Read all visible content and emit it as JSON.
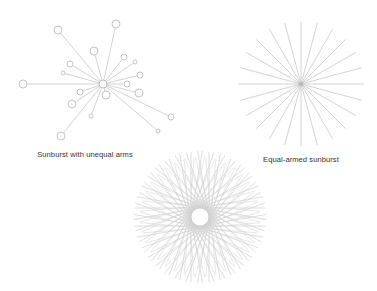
{
  "colors": {
    "line": "#c8c8c8",
    "node_stroke": "#bdbdbd",
    "label": "#333333",
    "background": "#ffffff"
  },
  "diagrams": [
    {
      "id": "unequal",
      "label": "Sunburst with unequal arms",
      "label_pos": [
        85,
        150
      ],
      "center": [
        103,
        84
      ],
      "center_radius": 4,
      "nodes": [
        {
          "x": 58,
          "y": 30,
          "r": 4
        },
        {
          "x": 116,
          "y": 24,
          "r": 4
        },
        {
          "x": 94,
          "y": 51,
          "r": 4
        },
        {
          "x": 70,
          "y": 64,
          "r": 3
        },
        {
          "x": 63,
          "y": 73,
          "r": 2
        },
        {
          "x": 124,
          "y": 57,
          "r": 3
        },
        {
          "x": 135,
          "y": 62,
          "r": 2
        },
        {
          "x": 140,
          "y": 75,
          "r": 3
        },
        {
          "x": 23,
          "y": 84,
          "r": 4
        },
        {
          "x": 127,
          "y": 84,
          "r": 3
        },
        {
          "x": 80,
          "y": 92,
          "r": 3
        },
        {
          "x": 139,
          "y": 93,
          "r": 4
        },
        {
          "x": 106,
          "y": 95,
          "r": 4
        },
        {
          "x": 72,
          "y": 104,
          "r": 4
        },
        {
          "x": 91,
          "y": 116,
          "r": 2
        },
        {
          "x": 171,
          "y": 117,
          "r": 3
        },
        {
          "x": 158,
          "y": 131,
          "r": 2
        },
        {
          "x": 61,
          "y": 136,
          "r": 4
        }
      ]
    },
    {
      "id": "equal",
      "label": "Equal-armed sunburst",
      "label_pos": [
        301,
        155
      ],
      "center": [
        301,
        84
      ],
      "spokes": 24,
      "radius": 63
    },
    {
      "id": "tangent",
      "label": "",
      "center": [
        200,
        217
      ],
      "lines": 36,
      "outer_radius": 66,
      "inner_radius": 9
    }
  ]
}
